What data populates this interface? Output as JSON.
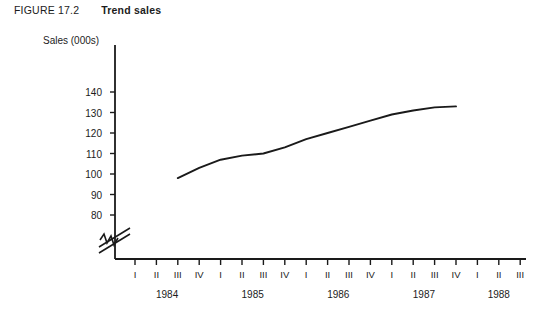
{
  "figure": {
    "number": "FIGURE 17.2",
    "title": "Trend sales"
  },
  "chart_data": {
    "type": "line",
    "title": "Trend sales",
    "xlabel": "",
    "ylabel": "Sales (000s)",
    "ylim": [
      80,
      145
    ],
    "yticks": [
      80,
      90,
      100,
      110,
      120,
      130,
      140
    ],
    "y_axis_break": true,
    "y_axis_break_note": "axis broken below 80",
    "grid": false,
    "legend": null,
    "categories": [
      "1984 I",
      "1984 II",
      "1984 III",
      "1984 IV",
      "1985 I",
      "1985 II",
      "1985 III",
      "1985 IV",
      "1986 I",
      "1986 II",
      "1986 III",
      "1986 IV",
      "1987 I",
      "1987 II",
      "1987 III",
      "1987 IV",
      "1988 I",
      "1988 II",
      "1988 III"
    ],
    "quarter_ticks": [
      "I",
      "II",
      "III",
      "IV",
      "I",
      "II",
      "III",
      "IV",
      "I",
      "II",
      "III",
      "IV",
      "I",
      "II",
      "III",
      "IV",
      "I",
      "II",
      "III"
    ],
    "years": [
      "1984",
      "1985",
      "1986",
      "1987",
      "1988"
    ],
    "series": [
      {
        "name": "Trend sales",
        "color": "#1a1a1a",
        "x": [
          "1984 III",
          "1984 IV",
          "1985 I",
          "1985 II",
          "1985 III",
          "1985 IV",
          "1986 I",
          "1986 II",
          "1986 III",
          "1986 IV",
          "1987 I",
          "1987 II",
          "1987 III",
          "1987 IV"
        ],
        "values": [
          98,
          103,
          107,
          109,
          110,
          113,
          117,
          120,
          123,
          126,
          129,
          131,
          132.5,
          133
        ]
      }
    ]
  },
  "axis_geometry": {
    "y_pixel_top": 92,
    "y_pixel_bottom": 215,
    "y_value_top": 140,
    "y_value_bottom": 80,
    "x_first_tick": 135,
    "x_tick_spacing": 21.4
  }
}
